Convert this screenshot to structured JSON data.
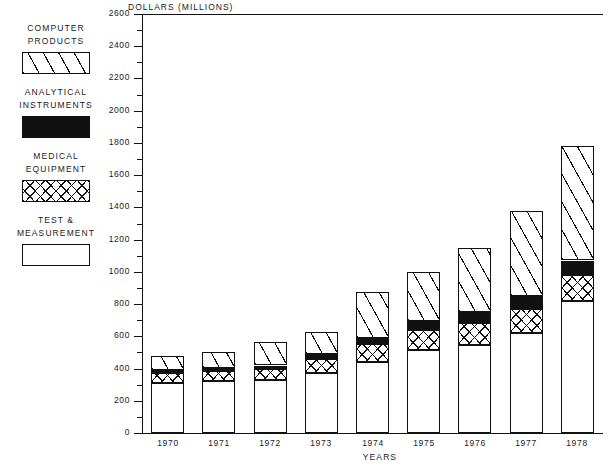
{
  "chart_data": {
    "type": "bar",
    "stacked": true,
    "title": "",
    "ylabel": "DOLLARS (MILLIONS)",
    "xlabel": "YEARS",
    "categories": [
      "1970",
      "1971",
      "1972",
      "1973",
      "1974",
      "1975",
      "1976",
      "1977",
      "1978"
    ],
    "ylim": [
      0,
      2600
    ],
    "ytick_step": 200,
    "yticks": [
      0,
      200,
      400,
      600,
      800,
      1000,
      1200,
      1400,
      1600,
      1800,
      2000,
      2200,
      2400,
      2600
    ],
    "ytick_labels": [
      "0",
      "200",
      "400",
      "600",
      "800",
      "1000",
      "1200",
      "1400",
      "1600",
      "1800",
      "2000",
      "2200",
      "2400",
      "2600"
    ],
    "minor_tick_step": 100,
    "grid": false,
    "legend_position": "left-outside",
    "series": [
      {
        "name": "TEST &\nMEASUREMENT",
        "key": "test",
        "pattern": "open-white",
        "values": [
          310,
          320,
          330,
          375,
          440,
          515,
          545,
          620,
          820
        ]
      },
      {
        "name": "MEDICAL\nEQUIPMENT",
        "key": "medical",
        "pattern": "cross-hatch",
        "values": [
          60,
          62,
          65,
          85,
          110,
          125,
          140,
          150,
          160
        ]
      },
      {
        "name": "ANALYTICAL\nINSTRUMENTS",
        "key": "analytical",
        "pattern": "solid-black",
        "values": [
          20,
          22,
          24,
          30,
          40,
          55,
          65,
          80,
          90
        ]
      },
      {
        "name": "COMPUTER\nPRODUCTS",
        "key": "computer",
        "pattern": "diagonal-hatch",
        "values": [
          90,
          100,
          145,
          135,
          285,
          305,
          400,
          530,
          710
        ]
      }
    ],
    "totals": [
      480,
      504,
      564,
      625,
      875,
      1000,
      1150,
      1380,
      1780
    ]
  },
  "legend": {
    "items": [
      {
        "label": "COMPUTER\nPRODUCTS",
        "swatch": "diagonal-hatch",
        "key": "computer"
      },
      {
        "label": "ANALYTICAL\nINSTRUMENTS",
        "swatch": "solid-black",
        "key": "analytical"
      },
      {
        "label": "MEDICAL\nEQUIPMENT",
        "swatch": "cross-hatch",
        "key": "medical"
      },
      {
        "label": "TEST &\nMEASUREMENT",
        "swatch": "open-white",
        "key": "test"
      }
    ]
  },
  "colors": {
    "ink": "#111111",
    "background": "#ffffff"
  }
}
